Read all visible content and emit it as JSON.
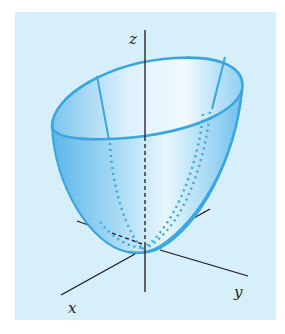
{
  "figure": {
    "axes": {
      "x_label": "x",
      "y_label": "y",
      "z_label": "z"
    },
    "colors": {
      "background": "#d6effa",
      "surface_edge": "#3aa6e0",
      "surface_fill_light": "#e6f5fd",
      "surface_fill_dark": "#4fb0e6",
      "axis": "#1a1a1a"
    }
  }
}
